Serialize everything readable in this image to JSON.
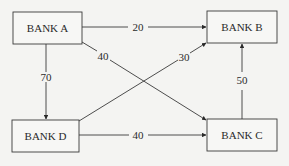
{
  "diagram": {
    "nodes": [
      {
        "id": "A",
        "label": "BANK A",
        "x": 13,
        "y": 12,
        "w": 69,
        "h": 32
      },
      {
        "id": "B",
        "label": "BANK B",
        "x": 207,
        "y": 11,
        "w": 70,
        "h": 32
      },
      {
        "id": "C",
        "label": "BANK C",
        "x": 207,
        "y": 119,
        "w": 70,
        "h": 32
      },
      {
        "id": "D",
        "label": "BANK D",
        "x": 12,
        "y": 120,
        "w": 67,
        "h": 32
      }
    ],
    "edges": [
      {
        "from": "A",
        "to": "B",
        "value": "20"
      },
      {
        "from": "A",
        "to": "C",
        "value": "40"
      },
      {
        "from": "A",
        "to": "D",
        "value": "70"
      },
      {
        "from": "D",
        "to": "B",
        "value": "30"
      },
      {
        "from": "D",
        "to": "C",
        "value": "40"
      },
      {
        "from": "C",
        "to": "B",
        "value": "50"
      }
    ],
    "colors": {
      "line": "#3a3a3a",
      "box_fill": "#f7f7f5",
      "background": "#f4f4f2"
    }
  }
}
